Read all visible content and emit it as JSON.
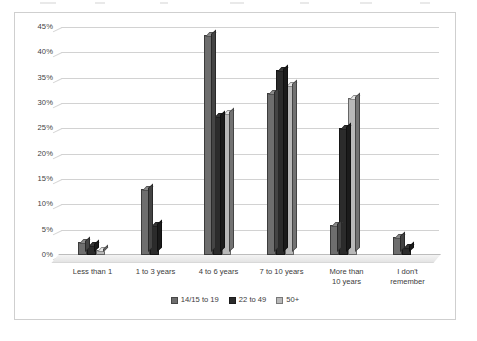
{
  "chart_data": {
    "type": "bar",
    "title": "",
    "subtitle": "",
    "xlabel": "",
    "ylabel": "",
    "ylim": [
      0,
      45
    ],
    "ytick_step": 5,
    "ytick_labels": [
      "0%",
      "5%",
      "10%",
      "15%",
      "20%",
      "25%",
      "30%",
      "35%",
      "40%",
      "45%"
    ],
    "grid": true,
    "grid_axis": "y",
    "legend_position": "bottom",
    "style": "3d-clustered-column",
    "categories": [
      "Less than 1",
      "1 to 3 years",
      "4 to 6 years",
      "7 to 10 years",
      "More than 10 years",
      "I don't remember"
    ],
    "series": [
      {
        "name": "14/15 to 19",
        "color": "#6e6e6e",
        "values": [
          2.5,
          13.0,
          43.5,
          32.0,
          6.0,
          3.5
        ]
      },
      {
        "name": "22 to 49",
        "color": "#2b2b2b",
        "values": [
          2.0,
          6.0,
          27.5,
          36.5,
          25.0,
          1.5
        ]
      },
      {
        "name": "50+",
        "color": "#b8b8b8",
        "values": [
          1.0,
          0.0,
          28.0,
          33.5,
          31.0,
          0.0
        ]
      }
    ]
  },
  "colors": {
    "series_1": "#6e6e6e",
    "series_2": "#2b2b2b",
    "series_3": "#b8b8b8",
    "gridline": "#d2d2d2",
    "frame": "#cfcfcf",
    "text": "#3b3b3b",
    "background": "#ffffff"
  }
}
